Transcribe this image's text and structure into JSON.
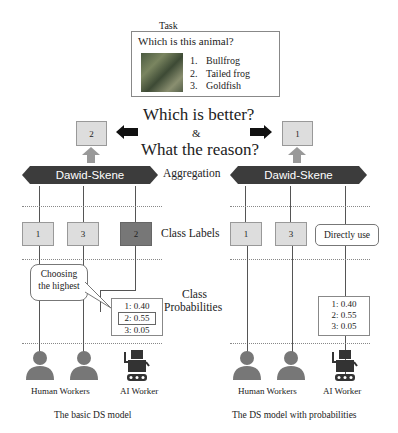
{
  "task": {
    "label": "Task",
    "question": "Which is this animal?",
    "options": [
      {
        "num": "1.",
        "text": "Bullfrog"
      },
      {
        "num": "2.",
        "text": "Tailed frog"
      },
      {
        "num": "3.",
        "text": "Goldfish"
      }
    ]
  },
  "center": {
    "line1": "Which is better?",
    "amp": "&",
    "line2": "What the reason?",
    "aggregation": "Aggregation",
    "class_labels": "Class Labels",
    "class_probabilities_1": "Class",
    "class_probabilities_2": "Probabilities"
  },
  "left": {
    "result": "2",
    "aggregator": "Dawid-Skene",
    "labels": [
      "1",
      "3",
      "2"
    ],
    "bubble": [
      "Choosing",
      "the highest"
    ],
    "probs": [
      "1: 0.40",
      "2: 0.55",
      "3: 0.05"
    ],
    "human_caption": "Human Workers",
    "ai_caption": "AI Worker",
    "title": "The basic DS model"
  },
  "right": {
    "result": "1",
    "aggregator": "Dawid-Skene",
    "labels": [
      "1",
      "3"
    ],
    "direct": "Directly use",
    "probs": [
      "1: 0.40",
      "2: 0.55",
      "3: 0.05"
    ],
    "human_caption": "Human Workers",
    "ai_caption": "AI Worker",
    "title": "The DS model with probabilities"
  },
  "colors": {
    "dark": "#3c3c3c",
    "box": "#dddddd",
    "arrow_gray": "#999999"
  }
}
